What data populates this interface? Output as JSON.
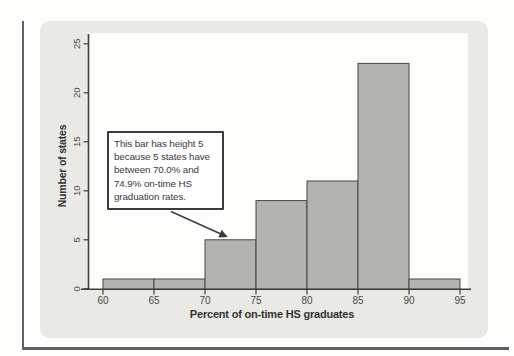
{
  "colors": {
    "page_bg": "#fdfdfc",
    "frame": "#606060",
    "panel_bg": "#e9e9e6",
    "plot_bg": "#fdfdfc",
    "bar_fill": "#b3b3b1",
    "bar_border": "#474745",
    "axis": "#3e3e3c",
    "tick_text": "#4a4a47",
    "title_text": "#343432",
    "callout_border": "#3b3b3b",
    "callout_bg": "#fefefe",
    "callout_text": "#3b3b3b",
    "arrow": "#3b3b3b"
  },
  "chart_data": {
    "type": "bar",
    "subtype": "histogram",
    "title": "",
    "xlabel": "Percent of on-time HS graduates",
    "ylabel": "Number of states",
    "bin_edges": [
      60,
      65,
      70,
      75,
      80,
      85,
      90,
      95
    ],
    "categories": [
      "60-64.9",
      "65-69.9",
      "70-74.9",
      "75-79.9",
      "80-84.9",
      "85-89.9",
      "90-94.9"
    ],
    "values": [
      1,
      1,
      5,
      9,
      11,
      23,
      1
    ],
    "x_ticks": [
      60,
      65,
      70,
      75,
      80,
      85,
      90,
      95
    ],
    "y_ticks": [
      0,
      5,
      10,
      15,
      20,
      25
    ],
    "xlim": [
      60,
      95
    ],
    "ylim": [
      0,
      25
    ],
    "grid": false,
    "legend": null,
    "annotation": {
      "lines": [
        "This bar has height 5",
        "because 5 states have",
        "between 70.0% and",
        "74.9% on-time HS",
        "graduation rates."
      ],
      "text": "This bar has height 5 because 5 states have between 70.0% and 74.9% on-time HS graduation rates.",
      "points_to_bin": "70-74.9"
    }
  }
}
